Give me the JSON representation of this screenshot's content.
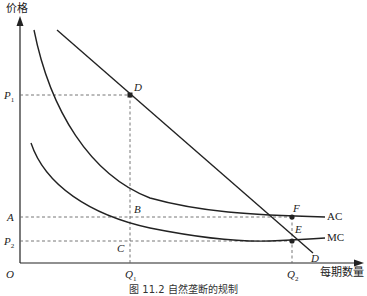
{
  "diagram": {
    "type": "economics-cost-curves",
    "y_axis_label": "价格",
    "x_axis_label": "每期数量",
    "origin_label": "O",
    "price_labels": {
      "p1": {
        "main": "P",
        "sub": "1"
      },
      "a": "A",
      "p2": {
        "main": "P",
        "sub": "2"
      }
    },
    "quantity_labels": {
      "q1": {
        "main": "Q",
        "sub": "1"
      },
      "q2": {
        "main": "Q",
        "sub": "2"
      }
    },
    "curves": [
      {
        "name": "D",
        "label": "D",
        "kind": "demand",
        "shape": "straight line, downward sloping"
      },
      {
        "name": "AC",
        "label": "AC",
        "kind": "average cost",
        "shape": "convex, declining"
      },
      {
        "name": "MC",
        "label": "MC",
        "kind": "marginal cost",
        "shape": "convex, declining then flat"
      }
    ],
    "points": {
      "d_top": "D",
      "b": "B",
      "c": "C",
      "f": "F",
      "e": "E"
    },
    "colors": {
      "line": "#222222",
      "dashed": "#666666",
      "background": "#ffffff"
    }
  },
  "caption": "图 11.2 自然垄断的规制"
}
